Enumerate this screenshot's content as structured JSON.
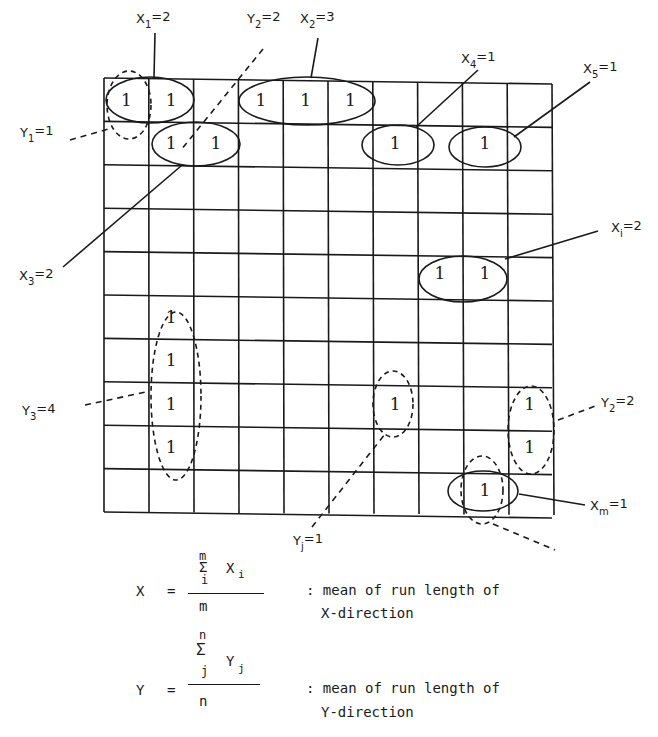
{
  "diagram": {
    "grid": {
      "cols": 10,
      "rows": 10
    },
    "cell_value": "1",
    "ones": [
      [
        0,
        0
      ],
      [
        0,
        1
      ],
      [
        0,
        3
      ],
      [
        0,
        4
      ],
      [
        0,
        5
      ],
      [
        1,
        1
      ],
      [
        1,
        2
      ],
      [
        1,
        6
      ],
      [
        1,
        8
      ],
      [
        4,
        7
      ],
      [
        4,
        8
      ],
      [
        5,
        1
      ],
      [
        6,
        1
      ],
      [
        7,
        1
      ],
      [
        8,
        1
      ],
      [
        7,
        6
      ],
      [
        7,
        9
      ],
      [
        8,
        9
      ],
      [
        9,
        8
      ]
    ],
    "labels": {
      "x1": {
        "main": "X",
        "sub": "1",
        "val": "=2"
      },
      "y2_top": {
        "main": "Y",
        "sub": "2",
        "val": "=2"
      },
      "x2": {
        "main": "X",
        "sub": "2",
        "val": "=3"
      },
      "x4": {
        "main": "X",
        "sub": "4",
        "val": "=1"
      },
      "x5": {
        "main": "X",
        "sub": "5",
        "val": "=1"
      },
      "y1": {
        "main": "Y",
        "sub": "1",
        "val": "=1"
      },
      "x3": {
        "main": "X",
        "sub": "3",
        "val": "=2"
      },
      "xi": {
        "main": "X",
        "sub": "i",
        "val": "=2"
      },
      "y3": {
        "main": "Y",
        "sub": "3",
        "val": "=4"
      },
      "y2_right": {
        "main": "Y",
        "sub": "2",
        "val": "=2"
      },
      "yj": {
        "main": "Y",
        "sub": "j",
        "val": "=1"
      },
      "xm": {
        "main": "X",
        "sub": "m",
        "val": "=1"
      }
    }
  },
  "formulas": {
    "x": {
      "lhs": "X",
      "eq": "=",
      "sum_top": "m",
      "sigma": "Σ",
      "sum_bottom": "i",
      "term": "X",
      "term_sub": "i",
      "denominator": "m",
      "desc_line1": ": mean of run length of",
      "desc_line2": "X-direction"
    },
    "y": {
      "lhs": "Y",
      "eq": "=",
      "sum_top": "n",
      "sigma": "Σ",
      "sum_bottom": "j",
      "term": "Y",
      "term_sub": "j",
      "denominator": "n",
      "desc_line1": ": mean of run length of",
      "desc_line2": "Y-direction"
    }
  }
}
